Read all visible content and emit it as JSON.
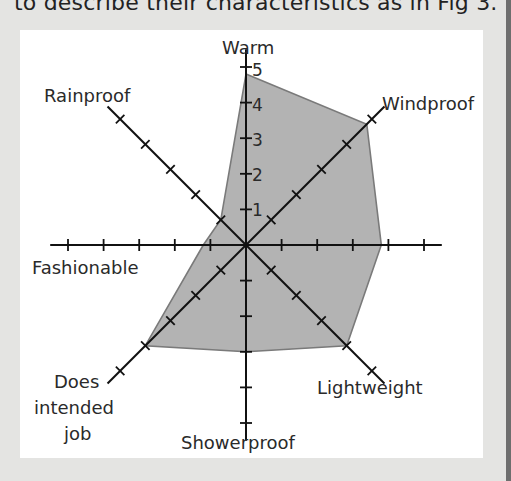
{
  "caption": "to describe their characteristics as in Fig 3.",
  "chart_data": {
    "type": "radar",
    "title": "",
    "axes": [
      "Warm",
      "Windproof",
      "",
      "Lightweight",
      "Showerproof",
      "Does intended job",
      "Fashionable",
      "Rainproof"
    ],
    "axis_labels_display": {
      "warm": "Warm",
      "windproof": "Windproof",
      "lightweight": "Lightweight",
      "showerproof": "Showerproof",
      "does_intended_job_line1": "Does",
      "does_intended_job_line2": "intended",
      "does_intended_job_line3": "job",
      "fashionable": "Fashionable",
      "rainproof": "Rainproof"
    },
    "values": [
      4.8,
      4.8,
      3.8,
      4,
      3,
      4,
      1.2,
      1
    ],
    "scale_ticks": [
      "1",
      "2",
      "3",
      "4",
      "5"
    ],
    "range": [
      0,
      5
    ],
    "fill_color": "#b3b3b3",
    "edge_color": "#7a7a7a",
    "grid": false,
    "legend": "none"
  },
  "colors": {
    "background": "#e4e4e2",
    "panel": "#ffffff",
    "axis": "#111111"
  }
}
